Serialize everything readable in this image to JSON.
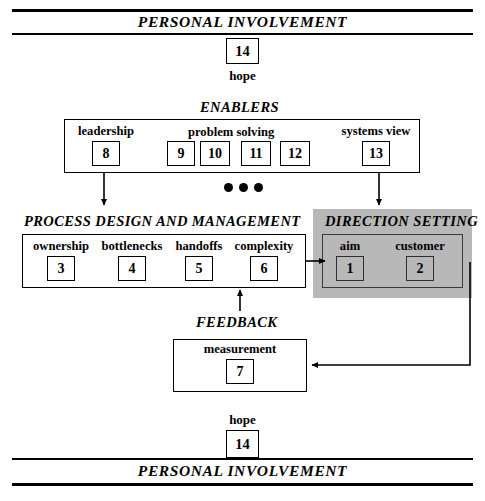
{
  "diagram": {
    "title_top": "PERSONAL INVOLVEMENT",
    "title_bottom": "PERSONAL INVOLVEMENT",
    "hope_top": {
      "label": "hope",
      "number": "14"
    },
    "hope_bottom": {
      "label": "hope",
      "number": "14"
    },
    "ellipsis": "•••",
    "sections": {
      "enablers": {
        "caption": "ENABLERS",
        "items": [
          {
            "label": "leadership",
            "number": "8"
          },
          {
            "label": "problem solving",
            "number": "9"
          },
          {
            "label": "",
            "number": "10"
          },
          {
            "label": "",
            "number": "11"
          },
          {
            "label": "",
            "number": "12"
          },
          {
            "label": "systems view",
            "number": "13"
          }
        ],
        "group_labels": [
          "leadership",
          "problem solving",
          "systems view"
        ]
      },
      "process": {
        "caption": "PROCESS DESIGN AND MANAGEMENT",
        "items": [
          {
            "label": "ownership",
            "number": "3"
          },
          {
            "label": "bottlenecks",
            "number": "4"
          },
          {
            "label": "handoffs",
            "number": "5"
          },
          {
            "label": "complexity",
            "number": "6"
          }
        ]
      },
      "direction": {
        "caption": "DIRECTION SETTING",
        "items": [
          {
            "label": "aim",
            "number": "1"
          },
          {
            "label": "customer",
            "number": "2"
          }
        ]
      },
      "feedback": {
        "caption": "FEEDBACK",
        "items": [
          {
            "label": "measurement",
            "number": "7"
          }
        ]
      }
    },
    "colors": {
      "line": "#000000",
      "shade": "#b8b8b8",
      "background": "#ffffff"
    }
  }
}
